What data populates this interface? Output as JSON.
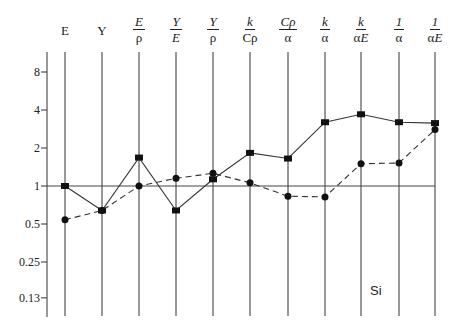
{
  "chart_data": {
    "type": "line",
    "title": "",
    "annotation": "Si",
    "xlabel": "",
    "ylabel": "",
    "yscale": "log2",
    "ylim": [
      0.11,
      11
    ],
    "yticks": [
      8,
      4,
      2,
      1,
      0.5,
      0.25,
      0.13
    ],
    "ytick_labels": [
      "8",
      "4",
      "2",
      "1",
      "0.5",
      "0.25",
      "0.13"
    ],
    "reference_line": 1,
    "categories": [
      "E",
      "Y",
      "E/ρ",
      "Y/E",
      "Y/ρ",
      "k/Cρ",
      "Cρ/α",
      "k/α",
      "k/αE",
      "1/α",
      "1/αE"
    ],
    "series": [
      {
        "name": "solid-squares",
        "style": "solid",
        "marker": "square",
        "values": [
          1.0,
          0.64,
          1.68,
          0.64,
          1.13,
          1.83,
          1.65,
          3.2,
          3.7,
          3.2,
          3.15
        ]
      },
      {
        "name": "dashed-circles",
        "style": "dashed",
        "marker": "circle",
        "values": [
          0.54,
          0.64,
          1.0,
          1.15,
          1.26,
          1.06,
          0.83,
          0.82,
          1.5,
          1.52,
          2.8
        ]
      }
    ]
  },
  "headers": [
    {
      "num": "E",
      "den": ""
    },
    {
      "num": "Y",
      "den": ""
    },
    {
      "num": "E",
      "den": "ρ"
    },
    {
      "num": "Y",
      "den": "E"
    },
    {
      "num": "Y",
      "den": "ρ"
    },
    {
      "num": "k",
      "den": "Cρ"
    },
    {
      "num": "Cρ",
      "den": "α"
    },
    {
      "num": "k",
      "den": "α"
    },
    {
      "num": "k",
      "den": "αE"
    },
    {
      "num": "1",
      "den": "α"
    },
    {
      "num": "1",
      "den": "αE"
    }
  ],
  "label": "Si"
}
